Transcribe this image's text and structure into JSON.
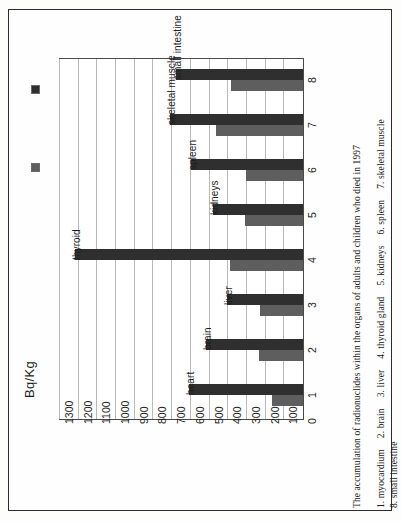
{
  "axis_title": "Bq/Kg",
  "legend": {
    "items": [
      {
        "label": "children",
        "color": "#2f2f2f",
        "key": "children"
      },
      {
        "label": "adults",
        "color": "#5e5e5e",
        "key": "adults"
      }
    ]
  },
  "caption": {
    "main": "The accumulation of radionuclides within the organs of adults and children who died in 1997",
    "key_items": [
      "1. myocardium",
      "2. brain",
      "3. liver",
      "4. thyroid gland",
      "5. kidneys",
      "6. spleen",
      "7. skeletal muscle",
      "8. small intestine"
    ]
  },
  "chart_data": {
    "type": "bar",
    "orientation": "horizontal",
    "title": "The accumulation of radionuclides within the organs of adults and children who died in 1997",
    "xlabel": "Bq/Kg",
    "ylabel": "",
    "xlim": [
      0,
      1300
    ],
    "grid": true,
    "legend_position": "top-left",
    "tick_labels": [
      "1300",
      "1200",
      "1100",
      "1000",
      "900",
      "800",
      "700",
      "600",
      "500",
      "400",
      "300",
      "200",
      "100",
      "0"
    ],
    "tick_values": [
      1300,
      1200,
      1100,
      1000,
      900,
      800,
      700,
      600,
      500,
      400,
      300,
      200,
      100,
      0
    ],
    "categories": [
      "1",
      "2",
      "3",
      "4",
      "5",
      "6",
      "7",
      "8"
    ],
    "category_names": [
      "heart",
      "brain",
      "liver",
      "thyroid",
      "kidneys",
      "spleen",
      "skeletal muscle",
      "small intestine"
    ],
    "bar_labels": [
      "heart",
      "brain",
      "liver",
      "thyroid",
      "kidneys",
      "spleen",
      "skeletal muscle",
      "small intestine"
    ],
    "series": [
      {
        "name": "children",
        "color": "#2f2f2f",
        "values": [
          610,
          520,
          405,
          1220,
          480,
          600,
          710,
          680
        ]
      },
      {
        "name": "adults",
        "color": "#5e5e5e",
        "values": [
          165,
          235,
          230,
          390,
          310,
          305,
          465,
          385
        ]
      }
    ]
  }
}
